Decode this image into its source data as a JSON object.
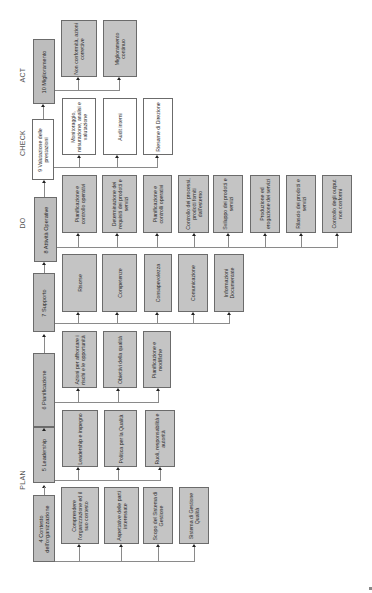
{
  "phases": {
    "plan": "PLAN",
    "do": "DO",
    "check": "CHECK",
    "act": "ACT"
  },
  "headers": [
    {
      "id": "4",
      "label": "4 Contesto dell'organizzazione"
    },
    {
      "id": "5",
      "label": "5 Leadership"
    },
    {
      "id": "6",
      "label": "6 Pianificazione"
    },
    {
      "id": "7",
      "label": "7 Supporto"
    },
    {
      "id": "8",
      "label": "8 Attività Operative"
    },
    {
      "id": "9",
      "label": "9 Valutazione delle prestazioni"
    },
    {
      "id": "10",
      "label": "10 Miglioramento"
    }
  ],
  "columns": {
    "contesto": [
      "Comprendere l'organizzazione ed il suo contesto",
      "Aspettative delle parti interessate",
      "Scopo del Sistema di Gestione",
      "Sistema di Gestione Qualità"
    ],
    "leadership": [
      "Leadership e impegno",
      "Politica per la Qualità",
      "Ruoli, responsabilità e autorità"
    ],
    "pianificazione": [
      "Azioni per affrontare i rischi e le opportunità",
      "Obiettivi della qualità",
      "Pianificazione e modifiche"
    ],
    "supporto": [
      "Risorse",
      "Competenze",
      "Consapevolezza",
      "Comunicazione",
      "Informazioni Documentate"
    ],
    "attivita": [
      "Pianificazione e controllo operativi",
      "Determinazione dei requisiti dei prodotti e servizi",
      "Pianificazione e controlli operativi",
      "Controllo dei processi, prodotti forniti dall'esterno",
      "Sviluppo dei prodotti e servizi",
      "Produzione ed erogazione dei servizi",
      "Rilascio dei prodotti e servizi",
      "Controllo degli output non conformi"
    ],
    "valutazione": [
      "Monitoraggio, misurazione, analisi e valutazione",
      "Audit interni",
      "Riesame di Direzione"
    ],
    "miglioramento": [
      "Non conformità, azioni correttive",
      "Miglioramento continuo"
    ]
  },
  "colors": {
    "box_fill": "#c4c4c4",
    "box_fill_check": "#ffffff",
    "border": "#6b6b6b",
    "connector": "#8a8a8a"
  }
}
